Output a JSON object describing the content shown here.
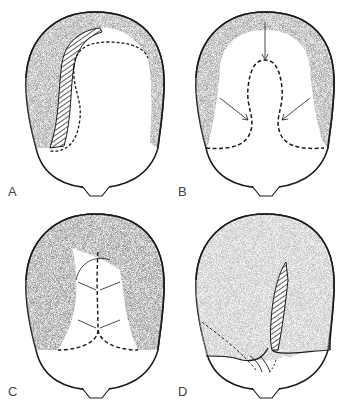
{
  "figure": {
    "panels": [
      {
        "id": "A",
        "label": "A",
        "description": "Scalp top view: shaded hair-bearing fringe with hatched flap strip along left side; dashed outline of bald area"
      },
      {
        "id": "B",
        "label": "B",
        "description": "Scalp top view: horseshoe shaded fringe; dashed mushroom-shaped excision outline with three arrows pointing inward"
      },
      {
        "id": "C",
        "label": "C",
        "description": "Scalp top view: mostly shaded; narrow bald strip with dashed midline and paired arrows converging"
      },
      {
        "id": "D",
        "label": "D",
        "description": "Scalp top view: fully shaded with hatched strip at mid; dashed lines and arrows at lower-left"
      }
    ]
  },
  "colors": {
    "outline": "#1a1a1a",
    "hair_fill": "#8c8c8c",
    "hair_fill_light": "#b4b4b4",
    "background": "#ffffff",
    "label": "#444444"
  }
}
